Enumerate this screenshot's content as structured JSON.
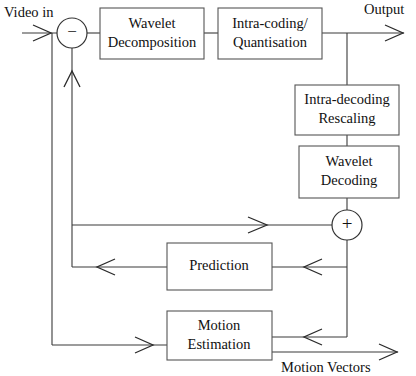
{
  "diagram": {
    "background_color": "#ffffff",
    "line_color": "#3a3a3a",
    "text_color": "#111111",
    "blocks": [
      {
        "id": "wavelet_decomposition",
        "line1": "Wavelet",
        "line2": "Decomposition"
      },
      {
        "id": "intra_coding",
        "line1": "Intra-coding/",
        "line2": "Quantisation"
      },
      {
        "id": "intra_decoding",
        "line1": "Intra-decoding",
        "line2": "Rescaling"
      },
      {
        "id": "wavelet_decoding",
        "line1": "Wavelet",
        "line2": "Decoding"
      },
      {
        "id": "prediction",
        "line1": "Prediction",
        "line2": ""
      },
      {
        "id": "motion_estimation",
        "line1": "Motion",
        "line2": "Estimation"
      }
    ],
    "operators": [
      {
        "id": "subtractor",
        "symbol": "−",
        "name": "minus"
      },
      {
        "id": "adder",
        "symbol": "+",
        "name": "plus"
      }
    ],
    "io_labels": [
      {
        "id": "video_in",
        "text": "Video in"
      },
      {
        "id": "output",
        "text": "Output"
      },
      {
        "id": "motion_vectors",
        "text": "Motion Vectors"
      }
    ]
  }
}
